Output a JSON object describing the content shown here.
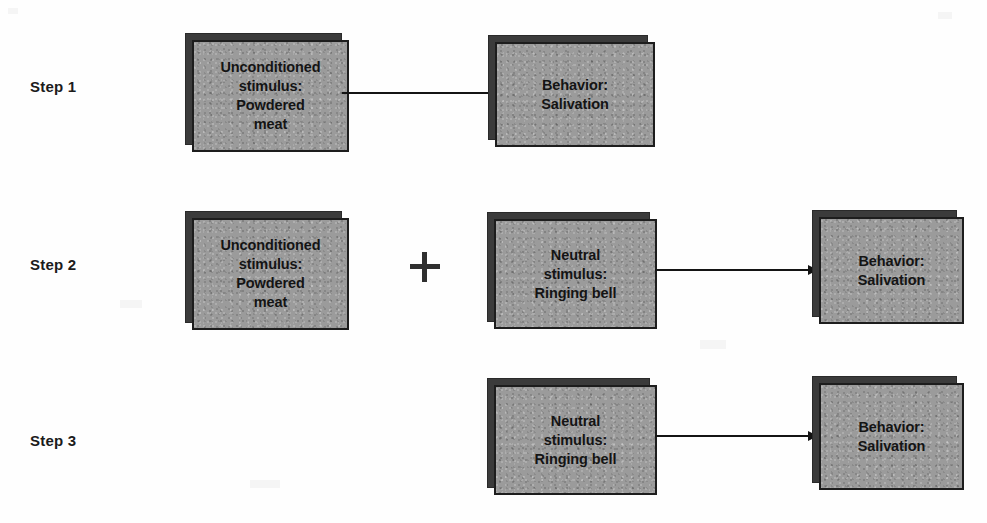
{
  "figure": {
    "background_color": "#ffffff",
    "box_fill_color": "#9b9b9b",
    "box_shadow_color": "#3b3b3b",
    "box_border_color": "#1d1d1d",
    "text_color": "#141414"
  },
  "steps": [
    {
      "label": "Step 1",
      "boxes": [
        {
          "name": "unconditioned-stimulus",
          "lines": [
            "Unconditioned",
            "stimulus:",
            "Powdered",
            "meat"
          ]
        },
        {
          "name": "behavior",
          "lines": [
            "Behavior:",
            "Salivation"
          ]
        }
      ],
      "connectors": [
        "arrow"
      ],
      "operators": []
    },
    {
      "label": "Step 2",
      "boxes": [
        {
          "name": "unconditioned-stimulus",
          "lines": [
            "Unconditioned",
            "stimulus:",
            "Powdered",
            "meat"
          ]
        },
        {
          "name": "neutral-stimulus",
          "lines": [
            "Neutral",
            "stimulus:",
            "Ringing bell"
          ]
        },
        {
          "name": "behavior",
          "lines": [
            "Behavior:",
            "Salivation"
          ]
        }
      ],
      "connectors": [
        "arrow"
      ],
      "operators": [
        "plus"
      ]
    },
    {
      "label": "Step 3",
      "boxes": [
        {
          "name": "neutral-stimulus",
          "lines": [
            "Neutral",
            "stimulus:",
            "Ringing bell"
          ]
        },
        {
          "name": "behavior",
          "lines": [
            "Behavior:",
            "Salivation"
          ]
        }
      ],
      "connectors": [
        "arrow"
      ],
      "operators": []
    }
  ],
  "operator_symbols": {
    "plus": "+"
  }
}
